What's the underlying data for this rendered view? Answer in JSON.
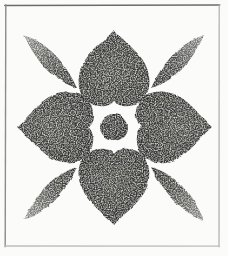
{
  "artwork": {
    "title": "Floral Rosette Rubbing",
    "medium": "charcoal rubbing",
    "caption": "Charcoal rubbing of a symmetrical eight-element floral rosette motif enclosed in a ruled rectangular border.",
    "canvas": {
      "width": 228,
      "height": 256
    },
    "colors": {
      "background": "#fdfdfc",
      "paper": "#fbfbfa",
      "ink_dark": "#3a3a38",
      "ink_mid": "#5e5e5b",
      "ink_light": "#8f8f8b",
      "border_top": "#6b6b69",
      "border_left": "#8c8c8a",
      "border_right": "#b2b2b0",
      "border_bottom": "#bdbdbb"
    },
    "border": {
      "name": "ruled-frame",
      "top_y": 5,
      "left_x": 5.5,
      "right_x": 219,
      "bottom_y": 246,
      "stroke_width": 1.4
    },
    "motif": {
      "name": "eight-point-rosette",
      "center": {
        "x": 114,
        "y": 127
      },
      "element_count": 9,
      "center_disc": {
        "name": "center-disc",
        "cx": 114,
        "cy": 127,
        "rx": 14,
        "ry": 13,
        "tone": "#3d3d3b"
      },
      "petals": [
        {
          "name": "petal-north",
          "direction": "north",
          "angle_deg": 0,
          "tip": {
            "x": 114,
            "y": 30
          },
          "length": 72,
          "half_width": 36,
          "tone": "#43433f"
        },
        {
          "name": "petal-east",
          "direction": "east",
          "angle_deg": 90,
          "tip": {
            "x": 212,
            "y": 127
          },
          "length": 72,
          "half_width": 36,
          "tone": "#45453f"
        },
        {
          "name": "petal-south",
          "direction": "south",
          "angle_deg": 180,
          "tip": {
            "x": 114,
            "y": 225
          },
          "length": 72,
          "half_width": 36,
          "tone": "#41413d"
        },
        {
          "name": "petal-west",
          "direction": "west",
          "angle_deg": 270,
          "tip": {
            "x": 17,
            "y": 127
          },
          "length": 72,
          "half_width": 36,
          "tone": "#45453f"
        }
      ],
      "leaves": [
        {
          "name": "leaf-northwest",
          "direction": "northwest",
          "angle_deg": 315,
          "outer_tip": {
            "x": 24,
            "y": 35
          },
          "inner_tip": {
            "x": 77,
            "y": 88
          },
          "half_width": 20,
          "tone_inner": "#4a4a46",
          "tone_outer": "#a6a6a1"
        },
        {
          "name": "leaf-northeast",
          "direction": "northeast",
          "angle_deg": 45,
          "outer_tip": {
            "x": 204,
            "y": 35
          },
          "inner_tip": {
            "x": 151,
            "y": 88
          },
          "half_width": 20,
          "tone_inner": "#4a4a46",
          "tone_outer": "#9b9b96"
        },
        {
          "name": "leaf-southeast",
          "direction": "southeast",
          "angle_deg": 135,
          "outer_tip": {
            "x": 204,
            "y": 220
          },
          "inner_tip": {
            "x": 151,
            "y": 167
          },
          "half_width": 20,
          "tone_inner": "#4a4a46",
          "tone_outer": "#a3a39e"
        },
        {
          "name": "leaf-southwest",
          "direction": "southwest",
          "angle_deg": 225,
          "outer_tip": {
            "x": 24,
            "y": 220
          },
          "inner_tip": {
            "x": 77,
            "y": 167
          },
          "half_width": 20,
          "tone_inner": "#4a4a46",
          "tone_outer": "#a8a8a3"
        }
      ]
    }
  }
}
